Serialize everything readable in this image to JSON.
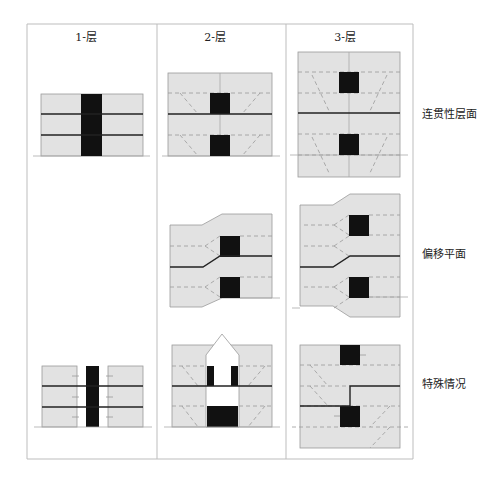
{
  "columns": [
    {
      "label": "1-层"
    },
    {
      "label": "2-层"
    },
    {
      "label": "3-层"
    }
  ],
  "rows": [
    {
      "label": "连贯性层面"
    },
    {
      "label": "偏移平面"
    },
    {
      "label": "特殊情况"
    }
  ],
  "colors": {
    "panel_fill": "#e2e2e2",
    "panel_stroke": "#9a9a9a",
    "core_fill": "#111111",
    "floor_line": "#222222",
    "dashed_line": "#999999",
    "frame_line": "#bdbdbd"
  }
}
